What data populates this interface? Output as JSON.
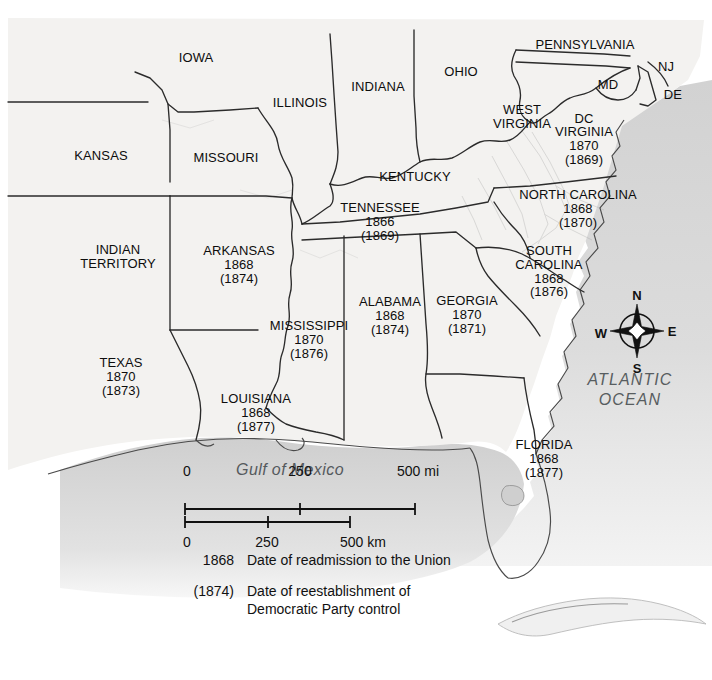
{
  "map": {
    "title_absent": true,
    "colors": {
      "land": "#f3f2f0",
      "ocean": "#d9d9d9",
      "border": "#2b2b2b",
      "text": "#0d0d0d",
      "water_text": "#585d60"
    },
    "states": [
      {
        "name": "IOWA",
        "admitted": "",
        "democratic": "",
        "x": 196,
        "y": 58
      },
      {
        "name": "ILLINOIS",
        "admitted": "",
        "democratic": "",
        "x": 300,
        "y": 103
      },
      {
        "name": "INDIANA",
        "admitted": "",
        "democratic": "",
        "x": 378,
        "y": 87
      },
      {
        "name": "OHIO",
        "admitted": "",
        "democratic": "",
        "x": 461,
        "y": 72
      },
      {
        "name": "PENNSYLVANIA",
        "admitted": "",
        "democratic": "",
        "x": 585,
        "y": 45
      },
      {
        "name": "NJ",
        "admitted": "",
        "democratic": "",
        "x": 666,
        "y": 67
      },
      {
        "name": "MD",
        "admitted": "",
        "democratic": "",
        "x": 608,
        "y": 85
      },
      {
        "name": "DE",
        "admitted": "",
        "democratic": "",
        "x": 673,
        "y": 95
      },
      {
        "name": "DC",
        "admitted": "",
        "democratic": "",
        "x": 584,
        "y": 119
      },
      {
        "name": "KANSAS",
        "admitted": "",
        "democratic": "",
        "x": 101,
        "y": 156
      },
      {
        "name": "MISSOURI",
        "admitted": "",
        "democratic": "",
        "x": 226,
        "y": 158
      },
      {
        "name": "KENTUCKY",
        "admitted": "",
        "democratic": "",
        "x": 415,
        "y": 177
      },
      {
        "name": "INDIAN TERRITORY",
        "admitted": "",
        "democratic": "",
        "x": 118,
        "y": 257
      },
      {
        "name": "WEST VIRGINIA",
        "admitted": "",
        "democratic": "",
        "x": 522,
        "y": 117
      },
      {
        "name": "VIRGINIA",
        "admitted": "1870",
        "democratic": "(1869)",
        "x": 584,
        "y": 146
      },
      {
        "name": "NORTH CAROLINA",
        "admitted": "1868",
        "democratic": "(1870)",
        "x": 578,
        "y": 209
      },
      {
        "name": "TENNESSEE",
        "admitted": "1866",
        "democratic": "(1869)",
        "x": 380,
        "y": 222
      },
      {
        "name": "SOUTH CAROLINA",
        "admitted": "1868",
        "democratic": "(1876)",
        "x": 549,
        "y": 272
      },
      {
        "name": "ARKANSAS",
        "admitted": "1868",
        "democratic": "(1874)",
        "x": 239,
        "y": 265
      },
      {
        "name": "GEORGIA",
        "admitted": "1870",
        "democratic": "(1871)",
        "x": 467,
        "y": 315
      },
      {
        "name": "ALABAMA",
        "admitted": "1868",
        "democratic": "(1874)",
        "x": 390,
        "y": 316
      },
      {
        "name": "MISSISSIPPI",
        "admitted": "1870",
        "democratic": "(1876)",
        "x": 309,
        "y": 340
      },
      {
        "name": "TEXAS",
        "admitted": "1870",
        "democratic": "(1873)",
        "x": 121,
        "y": 377
      },
      {
        "name": "LOUISIANA",
        "admitted": "1868",
        "democratic": "(1877)",
        "x": 256,
        "y": 413
      },
      {
        "name": "FLORIDA",
        "admitted": "1868",
        "democratic": "(1877)",
        "x": 544,
        "y": 459
      }
    ],
    "water_labels": [
      {
        "name": "ATLANTIC OCEAN",
        "lines": [
          "ATLANTIC",
          "OCEAN"
        ],
        "x": 630,
        "y": 390
      },
      {
        "name": "Gulf of Mexico",
        "lines": [
          "Gulf of Mexico"
        ],
        "x": 290,
        "y": 470
      }
    ]
  },
  "scale": {
    "miles": {
      "ticks": [
        "0",
        "250",
        "500 mi"
      ],
      "unit": "mi"
    },
    "kilometers": {
      "ticks": [
        "0",
        "250",
        "500 km"
      ],
      "unit": "km"
    }
  },
  "compass": {
    "north": "N",
    "east": "E",
    "south": "S",
    "west": "W"
  },
  "legend": {
    "rows": [
      {
        "key": "1868",
        "text": "Date of readmission to the Union"
      },
      {
        "key": "(1874)",
        "text": "Date of reestablishment of Democratic Party control"
      }
    ],
    "row2_line1": "Date of reestablishment of",
    "row2_line2": "Democratic Party control"
  }
}
